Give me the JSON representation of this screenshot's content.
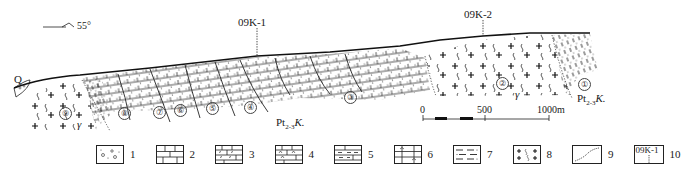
{
  "diagram": {
    "type": "geological-cross-section",
    "orientation": {
      "azimuth_label": "55°"
    },
    "boreholes": [
      {
        "id": "09K-1",
        "x": 257
      },
      {
        "id": "09K-2",
        "x": 483
      }
    ],
    "units": [
      {
        "num": "①",
        "label": "Pt₂-₃K."
      },
      {
        "num": "②",
        "label": "γ"
      },
      {
        "num": "③",
        "label": ""
      },
      {
        "num": "④",
        "label": ""
      },
      {
        "num": "⑤",
        "label": ""
      },
      {
        "num": "⑥",
        "label": ""
      },
      {
        "num": "⑦",
        "label": ""
      },
      {
        "num": "⑧",
        "label": ""
      },
      {
        "num": "⑨",
        "label": "γ"
      }
    ],
    "labels": {
      "quaternary": "Q",
      "formation_center": "Pt",
      "formation_center_sub": "2-3",
      "formation_center_suffix": "K.",
      "formation_right": "Pt",
      "formation_right_sub": "2-3",
      "formation_right_suffix": "K.",
      "granite_left": "γ",
      "granite_right": "γ"
    },
    "scale_bar": {
      "ticks": [
        "0",
        "500",
        "1000m"
      ]
    }
  },
  "legend": {
    "items": [
      {
        "num": "1",
        "pattern": "conglomerate-gravel"
      },
      {
        "num": "2",
        "pattern": "limestone-brick"
      },
      {
        "num": "3",
        "pattern": "dolomitic-marble"
      },
      {
        "num": "4",
        "pattern": "siliceous-marble"
      },
      {
        "num": "5",
        "pattern": "schist-marble"
      },
      {
        "num": "6",
        "pattern": "calc-schist"
      },
      {
        "num": "7",
        "pattern": "dashed-schist"
      },
      {
        "num": "8",
        "pattern": "granite-cross-wave"
      },
      {
        "num": "9",
        "pattern": "geological-boundary-line"
      },
      {
        "num": "10",
        "pattern": "borehole-marker",
        "box_text": "09K-1"
      }
    ]
  }
}
